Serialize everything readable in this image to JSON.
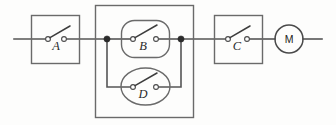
{
  "diagram": {
    "colors": {
      "background": "#fdfdfc",
      "wire": "#555555",
      "enclosure": "#6a6a6a",
      "blade": "#3d3d3d",
      "node": "#2b2b2b",
      "label": "#2a2a2a"
    },
    "switches": [
      {
        "id": "A",
        "label": "A",
        "shape": "rectangle",
        "state": "open"
      },
      {
        "id": "B",
        "label": "B",
        "shape": "rounded-rectangle",
        "state": "open"
      },
      {
        "id": "D",
        "label": "D",
        "shape": "ellipse",
        "state": "open"
      },
      {
        "id": "C",
        "label": "C",
        "shape": "rectangle",
        "state": "open"
      }
    ],
    "motor": {
      "id": "M",
      "label": "M",
      "shape": "circle"
    },
    "nodes": [
      {
        "id": "left-junction"
      },
      {
        "id": "right-junction"
      }
    ]
  }
}
